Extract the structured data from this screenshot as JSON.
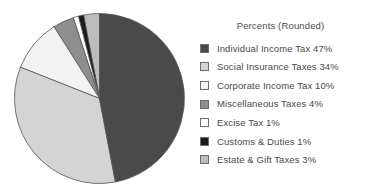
{
  "chart_data": {
    "type": "pie",
    "title": "Percents (Rounded)",
    "xlabel": "",
    "ylabel": "",
    "legend_position": "right",
    "grid": false,
    "start_angle_deg": 90,
    "direction": "counterclockwise",
    "categories": [
      "Individual Income Tax",
      "Social Insurance Taxes",
      "Corporate Income Tax",
      "Miscellaneous Taxes",
      "Excise Tax",
      "Customs & Duties",
      "Estate & Gift Taxes"
    ],
    "values": [
      47,
      34,
      10,
      4,
      1,
      1,
      3
    ],
    "value_suffix": "%",
    "colors": [
      "#4a4a4a",
      "#d4d4d4",
      "#f2f2f2",
      "#8e8e8e",
      "#ffffff",
      "#1a1a1a",
      "#bdbdbd"
    ],
    "slice_order_from_top_counterclockwise": [
      "Estate & Gift Taxes",
      "Customs & Duties",
      "Excise Tax",
      "Miscellaneous Taxes",
      "Corporate Income Tax",
      "Social Insurance Taxes",
      "Individual Income Tax"
    ]
  },
  "legend": {
    "title": "Percents (Rounded)",
    "items": [
      {
        "label": "Individual Income Tax 47%",
        "name": "individual-income-tax",
        "color": "#4a4a4a",
        "percent": 47
      },
      {
        "label": "Social Insurance Taxes 34%",
        "name": "social-insurance-taxes",
        "color": "#d4d4d4",
        "percent": 34
      },
      {
        "label": "Corporate Income Tax 10%",
        "name": "corporate-income-tax",
        "color": "#f2f2f2",
        "percent": 10
      },
      {
        "label": "Miscellaneous Taxes 4%",
        "name": "miscellaneous-taxes",
        "color": "#8e8e8e",
        "percent": 4
      },
      {
        "label": "Excise Tax 1%",
        "name": "excise-tax",
        "color": "#ffffff",
        "percent": 1
      },
      {
        "label": "Customs & Duties 1%",
        "name": "customs-and-duties",
        "color": "#1a1a1a",
        "percent": 1
      },
      {
        "label": "Estate & Gift Taxes 3%",
        "name": "estate-and-gift-taxes",
        "color": "#bdbdbd",
        "percent": 3
      }
    ]
  },
  "pie": {
    "center_x": 86.5,
    "center_y": 86.5,
    "radius": 85,
    "stroke": "#555555"
  }
}
